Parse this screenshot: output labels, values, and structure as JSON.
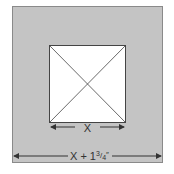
{
  "diagram": {
    "outer_square": {
      "fill": "#c4c4c4",
      "stroke": "#8a8a8a"
    },
    "inner_square": {
      "fill": "#ffffff",
      "stroke": "#444444",
      "diagonals": true
    },
    "inner_dimension": {
      "label": "X"
    },
    "outer_dimension": {
      "label_main": "X + 1",
      "label_fraction_num": "3",
      "label_fraction_den": "4",
      "label_unit": "″"
    },
    "colors": {
      "line": "#333333",
      "text": "#333333"
    }
  }
}
